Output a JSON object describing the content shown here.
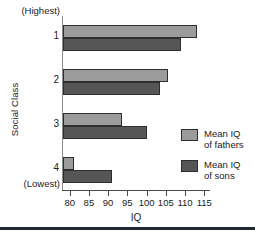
{
  "chart_data": {
    "type": "bar",
    "orientation": "horizontal",
    "title": "",
    "xlabel": "IQ",
    "ylabel": "Social Class",
    "categories": [
      "1",
      "2",
      "3",
      "4"
    ],
    "category_end_labels": {
      "top": "(Highest)",
      "bottom": "(Lowest)"
    },
    "series": [
      {
        "name": "Mean IQ of fathers",
        "color": "#9b9b9b",
        "values": [
          113,
          105.5,
          93.5,
          81
        ]
      },
      {
        "name": "Mean IQ of sons",
        "color": "#565656",
        "values": [
          109,
          103.5,
          100,
          91
        ]
      }
    ],
    "xlim": [
      78,
      116.5
    ],
    "xticks": [
      80,
      85,
      90,
      95,
      100,
      105,
      110,
      115
    ],
    "xtick_labels": [
      "80",
      "85",
      "90",
      "95",
      "100",
      "105",
      "110",
      "115"
    ],
    "grid": false,
    "legend_position": "right-middle"
  },
  "legend": {
    "items": [
      {
        "label_line1": "Mean IQ",
        "label_line2": "of fathers",
        "swatch": "fathers"
      },
      {
        "label_line1": "Mean IQ",
        "label_line2": "of sons",
        "swatch": "sons"
      }
    ]
  }
}
